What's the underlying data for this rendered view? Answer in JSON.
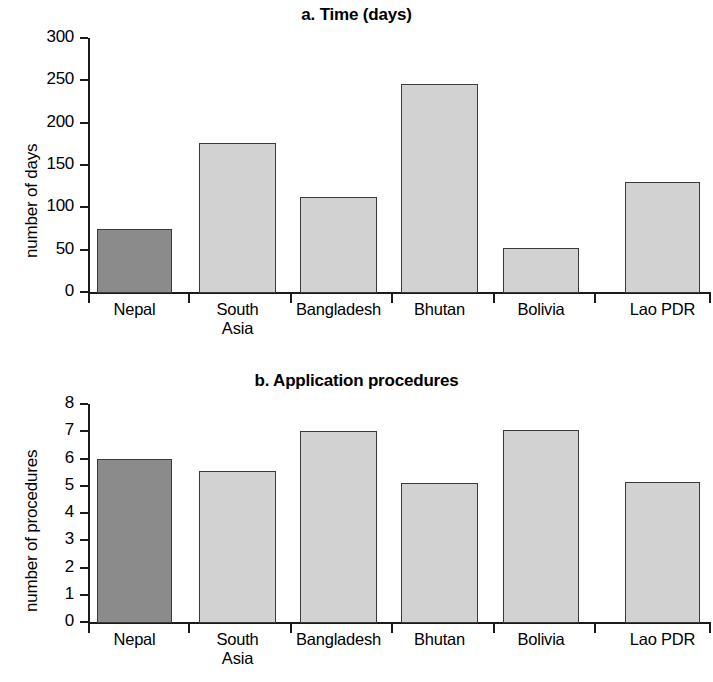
{
  "chart_data": [
    {
      "type": "bar",
      "panel": "a",
      "title": "a. Time (days)",
      "xlabel": "",
      "ylabel": "number of days",
      "categories": [
        "Nepal",
        "South Asia",
        "Bangladesh",
        "Bhutan",
        "Bolivia",
        "Lao PDR"
      ],
      "category_lines": [
        [
          "Nepal"
        ],
        [
          "South",
          "Asia"
        ],
        [
          "Bangladesh"
        ],
        [
          "Bhutan"
        ],
        [
          "Bolivia"
        ],
        [
          "Lao PDR"
        ]
      ],
      "values": [
        75,
        176,
        112,
        246,
        52,
        130
      ],
      "ylim": [
        0,
        300
      ],
      "yticks": [
        0,
        50,
        100,
        150,
        200,
        250,
        300
      ],
      "ytick_labels": [
        "0",
        "50",
        "100",
        "150",
        "200",
        "250",
        "300"
      ],
      "grid": false,
      "legend": "none",
      "highlight_index": 0,
      "colors": {
        "highlight": "#8b8b8b",
        "default": "#d2d2d2",
        "edge": "#3a3a3a",
        "axis": "#1a1a1a"
      }
    },
    {
      "type": "bar",
      "panel": "b",
      "title": "b. Application procedures",
      "xlabel": "",
      "ylabel": "number of procedures",
      "categories": [
        "Nepal",
        "South Asia",
        "Bangladesh",
        "Bhutan",
        "Bolivia",
        "Lao PDR"
      ],
      "category_lines": [
        [
          "Nepal"
        ],
        [
          "South",
          "Asia"
        ],
        [
          "Bangladesh"
        ],
        [
          "Bhutan"
        ],
        [
          "Bolivia"
        ],
        [
          "Lao PDR"
        ]
      ],
      "values": [
        6.0,
        5.55,
        7.0,
        5.1,
        7.05,
        5.15
      ],
      "ylim": [
        0,
        8
      ],
      "yticks": [
        0,
        1,
        2,
        3,
        4,
        5,
        6,
        7,
        8
      ],
      "ytick_labels": [
        "0",
        "1",
        "2",
        "3",
        "4",
        "5",
        "6",
        "7",
        "8"
      ],
      "grid": false,
      "legend": "none",
      "highlight_index": 0,
      "colors": {
        "highlight": "#8b8b8b",
        "default": "#d2d2d2",
        "edge": "#3a3a3a",
        "axis": "#1a1a1a"
      }
    }
  ]
}
